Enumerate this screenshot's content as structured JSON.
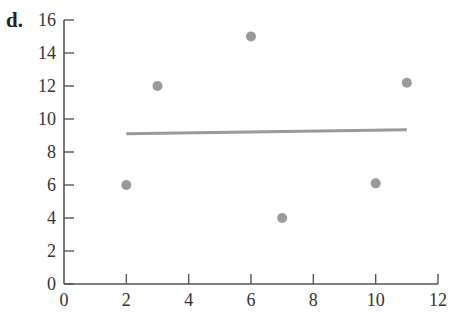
{
  "panel_label": "d.",
  "colors": {
    "axis": "#555555",
    "points": "#9a9a9a",
    "line": "#999999"
  },
  "chart_data": {
    "type": "scatter",
    "title": "",
    "xlabel": "",
    "ylabel": "",
    "xlim": [
      0,
      12
    ],
    "ylim": [
      0,
      16
    ],
    "x_ticks": [
      0,
      2,
      4,
      6,
      8,
      10,
      12
    ],
    "y_ticks": [
      0,
      2,
      4,
      6,
      8,
      10,
      12,
      14,
      16
    ],
    "grid": false,
    "legend": null,
    "series": [
      {
        "name": "points",
        "type": "scatter",
        "x": [
          2,
          3,
          6,
          7,
          10,
          11
        ],
        "y": [
          6,
          12,
          15,
          4,
          6.1,
          12.2
        ]
      },
      {
        "name": "regression line",
        "type": "line",
        "x": [
          2,
          11
        ],
        "y": [
          9.1,
          9.35
        ]
      }
    ]
  }
}
